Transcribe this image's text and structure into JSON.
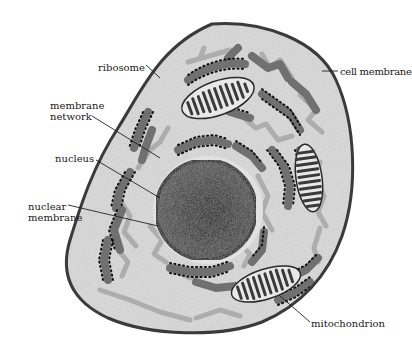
{
  "diagram": {
    "colors": {
      "background": "#ffffff",
      "cytoplasm": "#d9d9d9",
      "cell_membrane": "#3a3a3a",
      "nucleus": "#4a4a4a",
      "nucleus_center": "#1a1a1a",
      "nuclear_membrane": "#111111",
      "rough_er": "#6f6f6f",
      "ribosome_dots": "#111111",
      "membrane_network": "#a8a8a8",
      "mitochondrion_fill": "#e6e6e6",
      "mitochondrion_cristae": "#3c3c3c",
      "leader_line": "#222222",
      "label_text": "#1a1a1a"
    },
    "labels": [
      {
        "id": "ribosome",
        "text": "ribosome"
      },
      {
        "id": "membrane_network",
        "line1": "membrane",
        "line2": "network"
      },
      {
        "id": "nucleus",
        "text": "nucleus"
      },
      {
        "id": "nuclear_membrane",
        "line1": "nuclear",
        "line2": "membrane"
      },
      {
        "id": "cell_membrane",
        "text": "cell membrane"
      },
      {
        "id": "mitochondrion",
        "text": "mitochondrion"
      }
    ]
  }
}
